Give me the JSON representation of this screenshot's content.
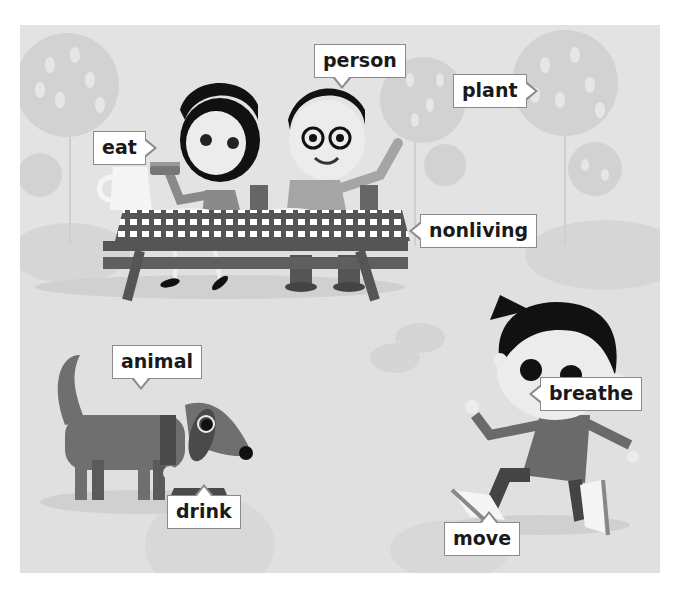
{
  "scene": {
    "description": "Picnic scene illustration with labeled living and nonliving things",
    "colors": {
      "background": "#e3e3e3",
      "label_fill": "#ffffff",
      "label_border": "#8a8a8a",
      "label_text": "#1a1a1a"
    }
  },
  "labels": {
    "eat": "eat",
    "person": "person",
    "plant": "plant",
    "nonliving": "nonliving",
    "animal": "animal",
    "drink": "drink",
    "breathe": "breathe",
    "move": "move"
  }
}
